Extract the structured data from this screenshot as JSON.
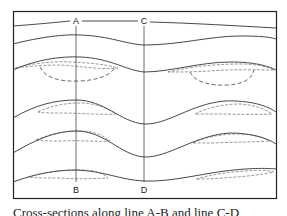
{
  "figure": {
    "labels": {
      "a": "A",
      "b": "B",
      "c": "C",
      "d": "D"
    },
    "caption": "Cross-sections along line A-B and line C-D",
    "colors": {
      "line": "#333333",
      "frame": "#222222",
      "background": "#ffffff"
    },
    "section_lines": [
      {
        "name": "A-B",
        "top_label": "A",
        "bottom_label": "B"
      },
      {
        "name": "C-D",
        "top_label": "C",
        "bottom_label": "D"
      }
    ]
  }
}
